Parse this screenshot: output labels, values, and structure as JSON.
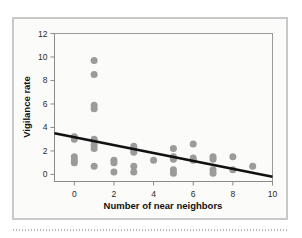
{
  "figure": {
    "background_color": "#fbfbf9",
    "frame_color": "#c9c9c9",
    "point_color": "#9b9b9b",
    "line_color": "#111111"
  },
  "chart_data": {
    "type": "scatter",
    "title": "",
    "xlabel": "Number of near neighbors",
    "ylabel": "Vigilance rate",
    "xlim": [
      -1,
      10
    ],
    "ylim": [
      -0.6,
      12
    ],
    "xticks": [
      0,
      2,
      4,
      6,
      8,
      10
    ],
    "xtick_labels": [
      "0",
      "2",
      "4",
      "6",
      "8",
      "10"
    ],
    "yticks": [
      0,
      2,
      4,
      6,
      8,
      10,
      12
    ],
    "ytick_labels": [
      "0",
      "2",
      "4",
      "6",
      "8",
      "10",
      "12"
    ],
    "grid": false,
    "legend": "none",
    "points": [
      {
        "x": 0,
        "y": 3.2
      },
      {
        "x": 0,
        "y": 3.0
      },
      {
        "x": 0,
        "y": 1.5
      },
      {
        "x": 0,
        "y": 1.2
      },
      {
        "x": 0,
        "y": 1.0
      },
      {
        "x": 1,
        "y": 9.7
      },
      {
        "x": 1,
        "y": 8.5
      },
      {
        "x": 1,
        "y": 5.9
      },
      {
        "x": 1,
        "y": 5.6
      },
      {
        "x": 1,
        "y": 3.0
      },
      {
        "x": 1,
        "y": 2.8
      },
      {
        "x": 1,
        "y": 2.5
      },
      {
        "x": 1,
        "y": 2.2
      },
      {
        "x": 1,
        "y": 0.7
      },
      {
        "x": 2,
        "y": 1.2
      },
      {
        "x": 2,
        "y": 1.0
      },
      {
        "x": 2,
        "y": 0.2
      },
      {
        "x": 3,
        "y": 2.4
      },
      {
        "x": 3,
        "y": 2.1
      },
      {
        "x": 3,
        "y": 1.9
      },
      {
        "x": 3,
        "y": 0.7
      },
      {
        "x": 3,
        "y": 0.2
      },
      {
        "x": 4,
        "y": 1.2
      },
      {
        "x": 5,
        "y": 2.2
      },
      {
        "x": 5,
        "y": 1.5
      },
      {
        "x": 5,
        "y": 1.3
      },
      {
        "x": 5,
        "y": 0.4
      },
      {
        "x": 5,
        "y": 0.1
      },
      {
        "x": 6,
        "y": 2.6
      },
      {
        "x": 6,
        "y": 1.4
      },
      {
        "x": 6,
        "y": 1.2
      },
      {
        "x": 7,
        "y": 1.5
      },
      {
        "x": 7,
        "y": 1.3
      },
      {
        "x": 7,
        "y": 0.4
      },
      {
        "x": 7,
        "y": 0.1
      },
      {
        "x": 8,
        "y": 1.5
      },
      {
        "x": 8,
        "y": 0.4
      },
      {
        "x": 9,
        "y": 0.7
      }
    ],
    "trend_line": {
      "x_start": -1,
      "y_start": 3.5,
      "x_end": 10,
      "y_end": -0.2
    }
  }
}
